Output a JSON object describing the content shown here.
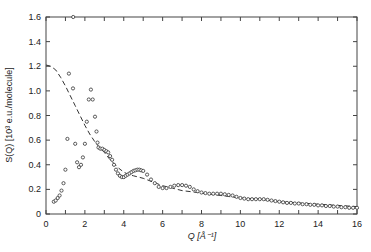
{
  "chart_data": {
    "type": "scatter",
    "title": "",
    "xlabel": "Q [Å⁻¹]",
    "ylabel": "S(Q) [10³ e.u./molecule]",
    "xlim": [
      0,
      16
    ],
    "ylim": [
      0,
      1.6
    ],
    "grid": false,
    "legend": "none",
    "x_ticks": [
      0,
      2,
      4,
      6,
      8,
      10,
      12,
      14,
      16
    ],
    "x_tick_labels": [
      "0",
      "2",
      "4",
      "6",
      "8",
      "10",
      "12",
      "14",
      "16"
    ],
    "y_ticks": [
      0,
      0.2,
      0.4,
      0.6,
      0.8,
      1.0,
      1.2,
      1.4,
      1.6
    ],
    "y_tick_labels": [
      "0",
      "0.2",
      "0.4",
      "0.6",
      "0.8",
      "1.0",
      "1.2",
      "1.4",
      "1.6"
    ],
    "series": [
      {
        "name": "experimental",
        "style": "open-circles",
        "x": [
          0.4,
          0.5,
          0.6,
          0.7,
          0.8,
          0.9,
          1.0,
          1.1,
          1.18,
          1.39,
          1.5,
          1.6,
          1.7,
          1.8,
          1.9,
          2.0,
          2.1,
          2.2,
          2.31,
          2.4,
          2.52,
          2.6,
          2.65,
          2.7,
          2.8,
          2.9,
          3.0,
          3.1,
          3.2,
          3.3,
          3.4,
          3.5,
          3.6,
          3.7,
          3.8,
          3.9,
          4.0,
          4.1,
          4.2,
          4.3,
          4.4,
          4.5,
          4.6,
          4.7,
          4.8,
          4.9,
          5.0,
          5.2,
          5.4,
          5.6,
          5.8,
          6.0,
          6.2,
          6.4,
          6.6,
          6.8,
          7.0,
          7.2,
          7.4,
          7.6,
          7.8,
          8.0,
          8.2,
          8.4,
          8.6,
          8.8,
          9.0,
          9.2,
          9.4,
          9.6,
          9.8,
          10.0,
          10.2,
          10.4,
          10.6,
          10.8,
          11.0,
          11.2,
          11.4,
          11.6,
          11.8,
          12.0,
          12.2,
          12.4,
          12.6,
          12.8,
          13.0,
          13.2,
          13.4,
          13.6,
          13.8,
          14.0,
          14.2,
          14.4,
          14.6,
          14.8,
          15.0,
          15.2,
          15.4,
          15.6,
          15.8,
          16.0,
          1.4
        ],
        "y": [
          0.1,
          0.11,
          0.13,
          0.15,
          0.19,
          0.25,
          0.36,
          0.61,
          1.14,
          1.02,
          0.57,
          0.42,
          0.38,
          0.4,
          0.46,
          0.57,
          0.75,
          0.93,
          1.01,
          0.93,
          0.79,
          0.67,
          0.58,
          0.54,
          0.53,
          0.53,
          0.52,
          0.51,
          0.5,
          0.47,
          0.44,
          0.4,
          0.36,
          0.33,
          0.31,
          0.3,
          0.3,
          0.31,
          0.32,
          0.33,
          0.34,
          0.35,
          0.355,
          0.36,
          0.36,
          0.355,
          0.35,
          0.32,
          0.28,
          0.25,
          0.22,
          0.21,
          0.21,
          0.22,
          0.23,
          0.235,
          0.235,
          0.23,
          0.22,
          0.2,
          0.185,
          0.175,
          0.17,
          0.165,
          0.165,
          0.165,
          0.165,
          0.16,
          0.155,
          0.15,
          0.14,
          0.13,
          0.125,
          0.12,
          0.12,
          0.12,
          0.12,
          0.12,
          0.115,
          0.11,
          0.105,
          0.1,
          0.095,
          0.09,
          0.09,
          0.085,
          0.085,
          0.08,
          0.08,
          0.075,
          0.075,
          0.07,
          0.07,
          0.065,
          0.065,
          0.06,
          0.06,
          0.055,
          0.055,
          0.05,
          0.05,
          0.05,
          1.6
        ]
      },
      {
        "name": "model",
        "style": "dashed",
        "x": [
          0,
          0.25,
          0.5,
          0.75,
          1.0,
          1.25,
          1.5,
          1.75,
          2.0,
          2.25,
          2.5,
          2.75,
          3.0,
          3.25,
          3.5,
          3.75,
          4.0,
          4.25,
          4.5,
          5.0,
          5.5,
          6.0,
          6.5,
          7.0,
          7.5,
          8.0,
          9.0,
          10.0,
          11.0,
          12.0,
          13.0,
          14.0,
          15.0,
          16.0
        ],
        "y": [
          1.21,
          1.2,
          1.17,
          1.11,
          1.04,
          0.96,
          0.88,
          0.8,
          0.72,
          0.65,
          0.59,
          0.54,
          0.5,
          0.45,
          0.41,
          0.37,
          0.34,
          0.32,
          0.31,
          0.29,
          0.26,
          0.23,
          0.21,
          0.19,
          0.18,
          0.17,
          0.15,
          0.13,
          0.12,
          0.1,
          0.09,
          0.08,
          0.07,
          0.06
        ]
      }
    ]
  }
}
